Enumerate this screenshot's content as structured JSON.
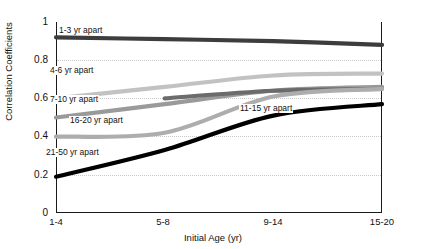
{
  "chart_data": {
    "type": "line",
    "title": "",
    "xlabel": "Initial Age (yr)",
    "ylabel": "Correlation Coefficients",
    "categories": [
      "1-4",
      "5-8",
      "9-14",
      "15-20"
    ],
    "ylim": [
      0,
      1
    ],
    "yticks": [
      "0",
      "0.2",
      "0.4",
      "0.6",
      "0.8",
      "1"
    ],
    "ytick_values": [
      0,
      0.2,
      0.4,
      0.6,
      0.8,
      1
    ],
    "grid": "horizontal-dotted",
    "legend": "inline-labels",
    "series": [
      {
        "name": "1-3 yr apart",
        "values": [
          0.92,
          0.91,
          0.9,
          0.88
        ],
        "color": "#3d3d3d",
        "width": 4.2
      },
      {
        "name": "4-6 yr apart",
        "values": [
          0.6,
          0.66,
          0.72,
          0.73
        ],
        "color": "#c2c2c2",
        "width": 4.2
      },
      {
        "name": "7-10 yr apart",
        "values": [
          0.5,
          0.57,
          0.64,
          0.66
        ],
        "color": "#9a9a9a",
        "width": 4.2
      },
      {
        "name": "11-15 yr apart",
        "values": [
          null,
          0.6,
          0.64,
          0.65
        ],
        "color": "#6b6b6b",
        "width": 4.2
      },
      {
        "name": "16-20 yr apart",
        "values": [
          0.4,
          0.42,
          0.61,
          0.65
        ],
        "color": "#adadad",
        "width": 4.2
      },
      {
        "name": "21-50 yr apart",
        "values": [
          0.19,
          0.33,
          0.51,
          0.57
        ],
        "color": "#000000",
        "width": 4.2
      }
    ],
    "series_label_positions": [
      {
        "name": "1-3 yr apart",
        "x": 58,
        "y": 26
      },
      {
        "name": "4-6 yr apart",
        "x": 49,
        "y": 66
      },
      {
        "name": "7-10 yr apart",
        "x": 49,
        "y": 95
      },
      {
        "name": "11-15 yr apart",
        "x": 239,
        "y": 104
      },
      {
        "name": "16-20 yr apart",
        "x": 69,
        "y": 116
      },
      {
        "name": "21-50 yr apart",
        "x": 45,
        "y": 148
      }
    ]
  }
}
